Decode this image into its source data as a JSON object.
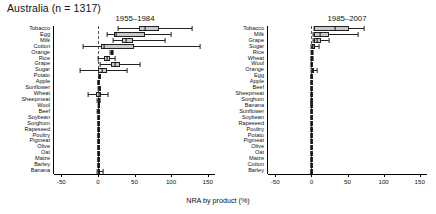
{
  "figure": {
    "title": "Australia (n = 1317)",
    "xlabel": "NRA by product (%)"
  },
  "chart_data": {
    "type": "box",
    "title": "Australia (n = 1317)",
    "xlabel": "NRA by product (%)",
    "ylabel": "",
    "xlim": [
      -60,
      160
    ],
    "xticks": [
      -50,
      0,
      50,
      100,
      150
    ],
    "xticklabels": [
      "-50",
      "0",
      "50",
      "100",
      "150"
    ],
    "grid": false,
    "legend": "none",
    "zero_reference_line": true,
    "panels": [
      {
        "name": "panel-left",
        "header": "1955–1984",
        "categories": [
          "Tobacco",
          "Egg",
          "Milk",
          "Cotton",
          "Orange",
          "Rice",
          "Grape",
          "Sugar",
          "Potato",
          "Apple",
          "Sunflower",
          "Wheat",
          "Sheepmeat",
          "Wool",
          "Beef",
          "Soybean",
          "Sorghum",
          "Rapeseed",
          "Poultry",
          "Pigmeat",
          "Olive",
          "Oat",
          "Maize",
          "Barley",
          "Banana"
        ],
        "boxes": [
          {
            "category": "Tobacco",
            "min": 28,
            "q1": 56,
            "median": 64,
            "q3": 84,
            "max": 128
          },
          {
            "category": "Egg",
            "min": 12,
            "q1": 22,
            "median": 25,
            "q3": 64,
            "max": 100
          },
          {
            "category": "Milk",
            "min": 20,
            "q1": 33,
            "median": 39,
            "q3": 48,
            "max": 92
          },
          {
            "category": "Cotton",
            "min": -21,
            "q1": 4,
            "median": 8,
            "q3": 49,
            "max": 140
          },
          {
            "category": "Orange",
            "min": 17,
            "q1": 18,
            "median": 19,
            "q3": 20,
            "max": 21
          },
          {
            "category": "Rice",
            "min": 0,
            "q1": 9,
            "median": 12,
            "q3": 16,
            "max": 23
          },
          {
            "category": "Grape",
            "min": 3,
            "q1": 18,
            "median": 23,
            "q3": 30,
            "max": 58
          },
          {
            "category": "Sugar",
            "min": -25,
            "q1": 0,
            "median": 5,
            "q3": 13,
            "max": 40
          },
          {
            "category": "Potato",
            "min": 1,
            "q1": 1,
            "median": 1,
            "q3": 1,
            "max": 1
          },
          {
            "category": "Apple",
            "min": 0,
            "q1": 0,
            "median": 0,
            "q3": 0,
            "max": 0
          },
          {
            "category": "Sunflower",
            "min": 0,
            "q1": 1,
            "median": 1,
            "q3": 2,
            "max": 3
          },
          {
            "category": "Wheat",
            "min": -13,
            "q1": -2,
            "median": 1,
            "q3": 4,
            "max": 14
          },
          {
            "category": "Sheepmeat",
            "min": -1,
            "q1": 0,
            "median": 1,
            "q3": 2,
            "max": 3
          },
          {
            "category": "Wool",
            "min": 0,
            "q1": 0,
            "median": 1,
            "q3": 1,
            "max": 2
          },
          {
            "category": "Beef",
            "min": -1,
            "q1": 0,
            "median": 0,
            "q3": 1,
            "max": 2
          },
          {
            "category": "Soybean",
            "min": 0,
            "q1": 0,
            "median": 0,
            "q3": 0,
            "max": 0
          },
          {
            "category": "Sorghum",
            "min": 0,
            "q1": 0,
            "median": 0,
            "q3": 0,
            "max": 0
          },
          {
            "category": "Rapeseed",
            "min": 0,
            "q1": 0,
            "median": 0,
            "q3": 0,
            "max": 0
          },
          {
            "category": "Poultry",
            "min": 0,
            "q1": 0,
            "median": 0,
            "q3": 0,
            "max": 0
          },
          {
            "category": "Pigmeat",
            "min": 0,
            "q1": 0,
            "median": 0,
            "q3": 0,
            "max": 0
          },
          {
            "category": "Olive",
            "min": 0,
            "q1": 0,
            "median": 0,
            "q3": 0,
            "max": 0
          },
          {
            "category": "Oat",
            "min": 0,
            "q1": 0,
            "median": 0,
            "q3": 0,
            "max": 0
          },
          {
            "category": "Maize",
            "min": 0,
            "q1": 0,
            "median": 0,
            "q3": 0,
            "max": 0
          },
          {
            "category": "Barley",
            "min": 0,
            "q1": 0,
            "median": 0,
            "q3": 0,
            "max": 0
          },
          {
            "category": "Banana",
            "min": -1,
            "q1": 0,
            "median": 1,
            "q3": 3,
            "max": 7
          }
        ]
      },
      {
        "name": "panel-right",
        "header": "1985–2007",
        "categories": [
          "Tobacco",
          "Milk",
          "Grape",
          "Sugar",
          "Rice",
          "Wheat",
          "Wool",
          "Orange",
          "Egg",
          "Apple",
          "Beef",
          "Sheepmeat",
          "Sorghum",
          "Banana",
          "Sunflower",
          "Soybean",
          "Rapeseed",
          "Poultry",
          "Potato",
          "Pigmeat",
          "Olive",
          "Oat",
          "Maize",
          "Cotton",
          "Barley"
        ],
        "boxes": [
          {
            "category": "Tobacco",
            "min": 3,
            "q1": 4,
            "median": 33,
            "q3": 52,
            "max": 73
          },
          {
            "category": "Milk",
            "min": 2,
            "q1": 4,
            "median": 12,
            "q3": 24,
            "max": 64
          },
          {
            "category": "Grape",
            "min": 2,
            "q1": 4,
            "median": 8,
            "q3": 14,
            "max": 24
          },
          {
            "category": "Sugar",
            "min": 0,
            "q1": 1,
            "median": 3,
            "q3": 5,
            "max": 11
          },
          {
            "category": "Rice",
            "min": 0,
            "q1": 0,
            "median": 1,
            "q3": 1,
            "max": 2
          },
          {
            "category": "Wheat",
            "min": -1,
            "q1": 0,
            "median": 0,
            "q3": 1,
            "max": 2
          },
          {
            "category": "Wool",
            "min": 0,
            "q1": 0,
            "median": 0,
            "q3": 1,
            "max": 1
          },
          {
            "category": "Orange",
            "min": 0,
            "q1": 1,
            "median": 2,
            "q3": 4,
            "max": 8
          },
          {
            "category": "Egg",
            "min": 0,
            "q1": 0,
            "median": 0,
            "q3": 0,
            "max": 0
          },
          {
            "category": "Apple",
            "min": 0,
            "q1": 0,
            "median": 0,
            "q3": 0,
            "max": 0
          },
          {
            "category": "Beef",
            "min": 0,
            "q1": 0,
            "median": 0,
            "q3": 0,
            "max": 0
          },
          {
            "category": "Sheepmeat",
            "min": 0,
            "q1": 0,
            "median": 0,
            "q3": 0,
            "max": 0
          },
          {
            "category": "Sorghum",
            "min": 0,
            "q1": 0,
            "median": 0,
            "q3": 0,
            "max": 0
          },
          {
            "category": "Banana",
            "min": 0,
            "q1": 0,
            "median": 0,
            "q3": 0,
            "max": 0
          },
          {
            "category": "Sunflower",
            "min": 0,
            "q1": 0,
            "median": 0,
            "q3": 0,
            "max": 0
          },
          {
            "category": "Soybean",
            "min": 0,
            "q1": 0,
            "median": 0,
            "q3": 0,
            "max": 0
          },
          {
            "category": "Rapeseed",
            "min": 0,
            "q1": 0,
            "median": 0,
            "q3": 0,
            "max": 0
          },
          {
            "category": "Poultry",
            "min": 0,
            "q1": 0,
            "median": 0,
            "q3": 0,
            "max": 0
          },
          {
            "category": "Potato",
            "min": 0,
            "q1": 0,
            "median": 0,
            "q3": 0,
            "max": 0
          },
          {
            "category": "Pigmeat",
            "min": 0,
            "q1": 0,
            "median": 0,
            "q3": 0,
            "max": 0
          },
          {
            "category": "Olive",
            "min": 0,
            "q1": 0,
            "median": 0,
            "q3": 0,
            "max": 0
          },
          {
            "category": "Oat",
            "min": 0,
            "q1": 0,
            "median": 0,
            "q3": 0,
            "max": 0
          },
          {
            "category": "Maize",
            "min": 0,
            "q1": 0,
            "median": 0,
            "q3": 0,
            "max": 0
          },
          {
            "category": "Cotton",
            "min": 0,
            "q1": 0,
            "median": 0,
            "q3": 0,
            "max": 0
          },
          {
            "category": "Barley",
            "min": 0,
            "q1": 0,
            "median": 0,
            "q3": 0,
            "max": 0
          }
        ]
      }
    ]
  },
  "style": {
    "box_fill": "#c9c9c9",
    "line_color": "#222222",
    "zero_line_color": "#555555"
  }
}
